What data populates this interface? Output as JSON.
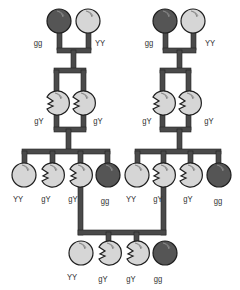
{
  "diagram": {
    "title": "",
    "colors": {
      "line": "#4a4a4a",
      "line_edge": "#222222",
      "pea_dark": "#555555",
      "pea_light": "#d6d6d6",
      "pea_outline": "#222222",
      "label": "#333333"
    },
    "generations": [
      {
        "name": "P",
        "families": [
          {
            "peas": [
              {
                "genotype": "gg",
                "shape": "round",
                "color": "dark"
              },
              {
                "genotype": "YY",
                "shape": "round",
                "color": "light"
              }
            ]
          },
          {
            "peas": [
              {
                "genotype": "gg",
                "shape": "round",
                "color": "dark"
              },
              {
                "genotype": "YY",
                "shape": "round",
                "color": "light"
              }
            ]
          }
        ]
      },
      {
        "name": "F1",
        "families": [
          {
            "peas": [
              {
                "genotype": "gY",
                "shape": "wrinkled",
                "color": "light"
              },
              {
                "genotype": "gY",
                "shape": "wrinkled",
                "color": "light"
              }
            ]
          },
          {
            "peas": [
              {
                "genotype": "gY",
                "shape": "wrinkled",
                "color": "light"
              },
              {
                "genotype": "gY",
                "shape": "wrinkled",
                "color": "light"
              }
            ]
          }
        ]
      },
      {
        "name": "F2",
        "families": [
          {
            "peas": [
              {
                "genotype": "YY",
                "shape": "round",
                "color": "light"
              },
              {
                "genotype": "gY",
                "shape": "wrinkled",
                "color": "light"
              },
              {
                "genotype": "gY",
                "shape": "wrinkled",
                "color": "light"
              },
              {
                "genotype": "gg",
                "shape": "round",
                "color": "dark"
              }
            ]
          },
          {
            "peas": [
              {
                "genotype": "YY",
                "shape": "round",
                "color": "light"
              },
              {
                "genotype": "gY",
                "shape": "wrinkled",
                "color": "light"
              },
              {
                "genotype": "gY",
                "shape": "wrinkled",
                "color": "light"
              },
              {
                "genotype": "gg",
                "shape": "round",
                "color": "dark"
              }
            ]
          }
        ]
      },
      {
        "name": "F3",
        "families": [
          {
            "peas": [
              {
                "genotype": "YY",
                "shape": "round",
                "color": "light"
              },
              {
                "genotype": "gY",
                "shape": "wrinkled",
                "color": "light"
              },
              {
                "genotype": "gY",
                "shape": "wrinkled",
                "color": "light"
              },
              {
                "genotype": "gg",
                "shape": "round",
                "color": "dark"
              }
            ]
          }
        ]
      }
    ]
  }
}
